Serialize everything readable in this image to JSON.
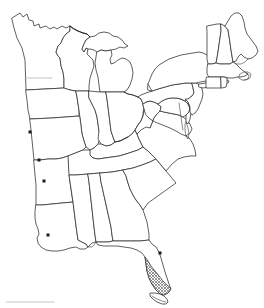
{
  "map": {
    "title": "Eastern United States Outline Map",
    "type": "outline-map",
    "projection_note": "eastern half of the contiguous United States",
    "background_color": "#ffffff",
    "outline_color": "#2b2b2b",
    "shading_color": "#808080",
    "marker_color": "#1a1a1a",
    "marker_shape": "square",
    "marker_size_px": 3,
    "canvas": {
      "width": 264,
      "height": 308
    },
    "shaded_regions": [
      {
        "name": "southern-florida-everglades",
        "label": "Southern Florida",
        "fill_pattern": "cross-hatch",
        "pattern_color": "#777777"
      }
    ],
    "markers": [
      {
        "name": "marker-iowa",
        "state": "Iowa",
        "x": 30,
        "y": 132
      },
      {
        "name": "marker-missouri",
        "state": "Missouri",
        "x": 39,
        "y": 160
      },
      {
        "name": "marker-arkansas",
        "state": "Arkansas",
        "x": 44,
        "y": 181
      },
      {
        "name": "marker-louisiana",
        "state": "Louisiana",
        "x": 48,
        "y": 235
      },
      {
        "name": "marker-florida",
        "state": "Florida",
        "x": 160,
        "y": 253
      }
    ],
    "states": [
      "Minnesota",
      "Wisconsin",
      "Michigan",
      "Iowa",
      "Illinois",
      "Indiana",
      "Ohio",
      "Missouri",
      "Kentucky",
      "Tennessee",
      "Arkansas",
      "Louisiana",
      "Mississippi",
      "Alabama",
      "Georgia",
      "Florida",
      "South Carolina",
      "North Carolina",
      "Virginia",
      "West Virginia",
      "Maryland",
      "Delaware",
      "Pennsylvania",
      "New Jersey",
      "New York",
      "Connecticut",
      "Rhode Island",
      "Massachusetts",
      "Vermont",
      "New Hampshire",
      "Maine"
    ]
  }
}
